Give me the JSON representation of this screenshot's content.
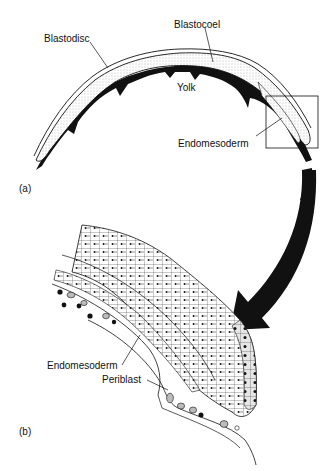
{
  "figure": {
    "panel_a": {
      "label": "(a)",
      "annotations": {
        "blastodisc": "Blastodisc",
        "blastocoel": "Blastocoel",
        "yolk": "Yolk",
        "endomesoderm": "Endomesoderm"
      }
    },
    "panel_b": {
      "label": "(b)",
      "annotations": {
        "endomesoderm": "Endomesoderm",
        "periblast": "Periblast"
      }
    },
    "colors": {
      "ink": "#111111",
      "stipple": "#cfcfcf",
      "background": "#ffffff"
    }
  }
}
